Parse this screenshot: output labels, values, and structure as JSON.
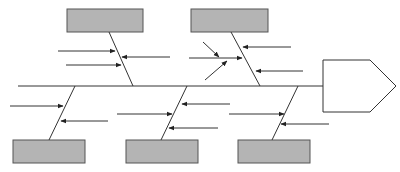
{
  "diagram": {
    "type": "fishbone",
    "title": "",
    "colors": {
      "box_fill": "#b4b4b4",
      "box_stroke": "#555555",
      "line": "#333333",
      "background": "#ffffff"
    },
    "effect": {
      "label": ""
    },
    "categories": [
      {
        "position": "top-left",
        "label": "",
        "sub_causes": 3
      },
      {
        "position": "top-right",
        "label": "",
        "sub_causes": 5
      },
      {
        "position": "bottom-left",
        "label": "",
        "sub_causes": 2
      },
      {
        "position": "bottom-middle",
        "label": "",
        "sub_causes": 3
      },
      {
        "position": "bottom-right",
        "label": "",
        "sub_causes": 2
      }
    ]
  }
}
